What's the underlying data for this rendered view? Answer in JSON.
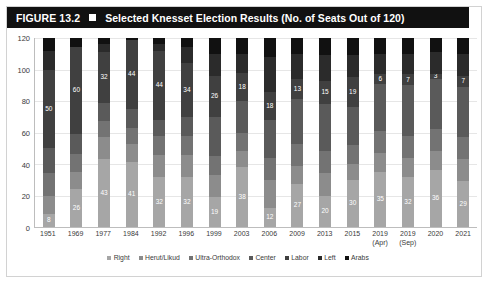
{
  "figure": {
    "number_label": "FIGURE 13.2",
    "bullet_icon": "filled-square-icon",
    "title": "Selected Knesset Election Results (No. of Seats Out of 120)"
  },
  "chart_data": {
    "type": "bar",
    "stacked": true,
    "title": "Selected Knesset Election Results (No. of Seats Out of 120)",
    "xlabel": "",
    "ylabel": "",
    "ylim": [
      0,
      120
    ],
    "yticks": [
      0,
      20,
      40,
      60,
      80,
      100,
      120
    ],
    "grid": true,
    "legend_position": "bottom",
    "categories": [
      "1951",
      "1969",
      "1977",
      "1984",
      "1992",
      "1996",
      "1999",
      "2003",
      "2006",
      "2009",
      "2013",
      "2015",
      "2019 (Apr)",
      "2019 (Sep)",
      "2020",
      "2021"
    ],
    "categories_multiline": [
      [
        "1951"
      ],
      [
        "1969"
      ],
      [
        "1977"
      ],
      [
        "1984"
      ],
      [
        "1992"
      ],
      [
        "1996"
      ],
      [
        "1999"
      ],
      [
        "2003"
      ],
      [
        "2006"
      ],
      [
        "2009"
      ],
      [
        "2013"
      ],
      [
        "2015"
      ],
      [
        "2019",
        "(Apr)"
      ],
      [
        "2019",
        "(Sep)"
      ],
      [
        "2020"
      ],
      [
        "2021"
      ]
    ],
    "series": [
      {
        "name": "Right",
        "color": "#a6a6a6",
        "values": [
          8,
          26,
          43,
          41,
          32,
          32,
          19,
          38,
          12,
          27,
          20,
          30,
          35,
          32,
          36,
          29
        ]
      },
      {
        "name": "Herut/Likud",
        "color": "#8c8c8c",
        "values": [
          12,
          12,
          14,
          12,
          14,
          14,
          14,
          10,
          18,
          12,
          14,
          10,
          12,
          12,
          12,
          14
        ]
      },
      {
        "name": "Ultra-Orthodox",
        "color": "#737373",
        "values": [
          14,
          12,
          10,
          10,
          12,
          12,
          12,
          12,
          14,
          14,
          14,
          12,
          14,
          14,
          14,
          14
        ]
      },
      {
        "name": "Center",
        "color": "#5a5a5a",
        "values": [
          16,
          14,
          12,
          12,
          10,
          12,
          25,
          20,
          24,
          28,
          30,
          24,
          30,
          32,
          32,
          32
        ]
      },
      {
        "name": "Labor",
        "color": "#404040",
        "values": [
          50,
          60,
          32,
          44,
          44,
          34,
          26,
          18,
          18,
          13,
          15,
          19,
          6,
          7,
          3,
          7
        ]
      },
      {
        "name": "Left",
        "color": "#2b2b2b",
        "values": [
          12,
          0,
          5,
          0,
          4,
          10,
          14,
          12,
          22,
          16,
          16,
          14,
          13,
          13,
          14,
          14
        ]
      },
      {
        "name": "Arabs",
        "color": "#111111",
        "values": [
          8,
          6,
          4,
          1,
          4,
          6,
          10,
          10,
          12,
          10,
          11,
          11,
          10,
          10,
          9,
          10
        ]
      }
    ],
    "visible_value_labels": {
      "1951": {
        "Right": "8",
        "Labor": "50"
      },
      "1969": {
        "Right": "26",
        "Labor": "60"
      },
      "1977": {
        "Right": "43",
        "Labor": "32"
      },
      "1984": {
        "Right": "41",
        "Labor": "44"
      },
      "1992": {
        "Right": "32",
        "Labor": "44"
      },
      "1996": {
        "Right": "32",
        "Labor": "34"
      },
      "1999": {
        "Right": "19",
        "Labor": "26"
      },
      "2003": {
        "Right": "38",
        "Labor": "18"
      },
      "2006": {
        "Right": "12",
        "Labor": "18"
      },
      "2009": {
        "Right": "27",
        "Labor": "13"
      },
      "2013": {
        "Right": "20",
        "Labor": "15"
      },
      "2015": {
        "Right": "30",
        "Labor": "19"
      },
      "2019 (Apr)": {
        "Right": "35",
        "Labor": "6"
      },
      "2019 (Sep)": {
        "Right": "32",
        "Labor": "7"
      },
      "2020": {
        "Right": "36",
        "Labor": "3"
      },
      "2021": {
        "Right": "29",
        "Labor": "7"
      }
    }
  }
}
